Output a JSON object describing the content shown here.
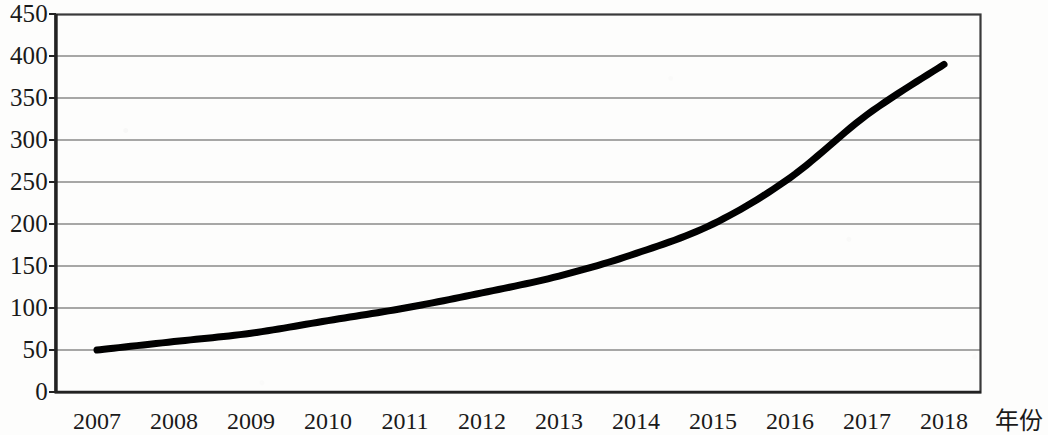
{
  "chart_data": {
    "type": "line",
    "title": "",
    "subtitle": "",
    "xlabel": "年份",
    "ylabel": "",
    "categories": [
      "2007",
      "2008",
      "2009",
      "2010",
      "2011",
      "2012",
      "2013",
      "2014",
      "2015",
      "2016",
      "2017",
      "2018"
    ],
    "values": [
      50,
      60,
      70,
      85,
      100,
      118,
      138,
      165,
      200,
      255,
      330,
      390
    ],
    "series": [
      {
        "name": "",
        "values": [
          50,
          60,
          70,
          85,
          100,
          118,
          138,
          165,
          200,
          255,
          330,
          390
        ]
      }
    ],
    "ylim": [
      0,
      450
    ],
    "ytick_labels": [
      "450",
      "400",
      "350",
      "300",
      "250",
      "200",
      "150",
      "100",
      "50",
      "0"
    ],
    "ytick_values": [
      450,
      400,
      350,
      300,
      250,
      200,
      150,
      100,
      50,
      0
    ],
    "grid": true,
    "grid_axis": "y",
    "legend": false,
    "legend_position": "none",
    "line_color": "#000000",
    "line_width_px": 7,
    "markers": false,
    "axis_color": "#3a3a3a",
    "grid_color": "#8a8a8a",
    "plot_background": "#ffffff",
    "annotations": []
  }
}
